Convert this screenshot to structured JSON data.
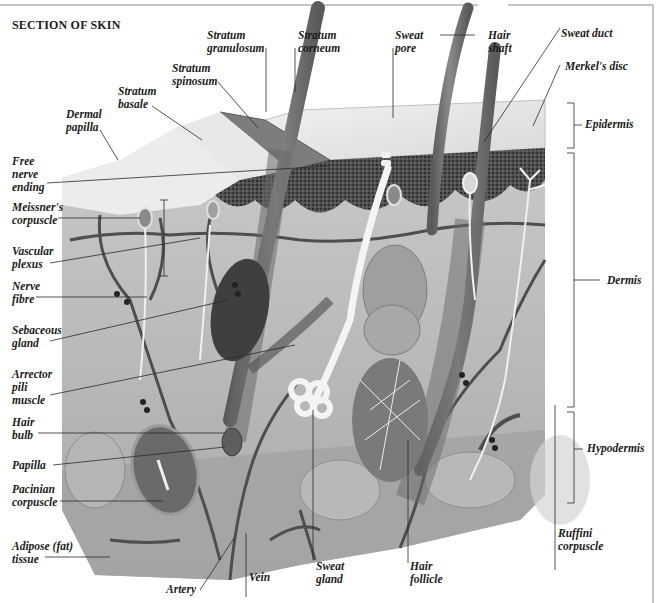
{
  "title": "SECTION OF SKIN",
  "header_ghost_text": "... ... ...",
  "colors": {
    "background": "#ffffff",
    "line": "#2a2a2a",
    "frame": "#8a8a8a",
    "epidermis_surface": "#e6e6e6",
    "epidermis_dark": "#3a3a3a",
    "dermis": "#bdbdbd",
    "hypodermis": "#a8a8a8",
    "vessel": "#555555",
    "nerve": "#f2f2f2"
  },
  "labels": {
    "stratum_granulosum": "Stratum\ngranulosum",
    "stratum_corneum": "Stratum\ncorneum",
    "sweat_pore": "Sweat\npore",
    "hair_shaft": "Hair\nshaft",
    "sweat_duct": "Sweat duct",
    "merkels_disc": "Merkel's disc",
    "stratum_spinosum": "Stratum\nspinosum",
    "stratum_basale": "Stratum\nbasale",
    "dermal_papilla": "Dermal\npapilla",
    "free_nerve_ending": "Free\nnerve\nending",
    "meissners_corpuscle": "Meissner's\ncorpuscle",
    "vascular_plexus": "Vascular\nplexus",
    "nerve_fibre": "Nerve\nfibre",
    "sebaceous_gland": "Sebaceous\ngland",
    "arrector_pili_muscle": "Arrector\npili\nmuscle",
    "hair_bulb": "Hair\nbulb",
    "papilla": "Papilla",
    "pacinian_corpuscle": "Pacinian\ncorpuscle",
    "adipose_tissue": "Adipose (fat)\ntissue",
    "artery": "Artery",
    "vein": "Vein",
    "sweat_gland": "Sweat\ngland",
    "hair_follicle": "Hair\nfollicle",
    "ruffini_corpuscle": "Ruffini\ncorpuscle"
  },
  "layers": {
    "epidermis": "Epidermis",
    "dermis": "Dermis",
    "hypodermis": "Hypodermis"
  }
}
